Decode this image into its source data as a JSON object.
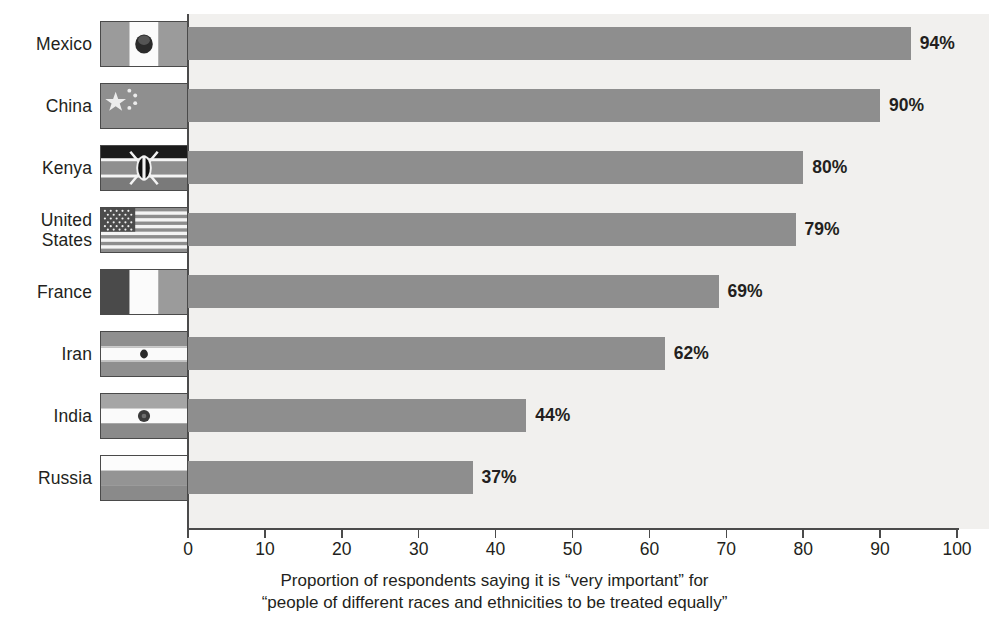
{
  "chart_data": {
    "type": "bar",
    "orientation": "horizontal",
    "title": "",
    "xlabel": "Proportion of respondents saying it is “very important” for “people of different races and ethnicities to be treated equally”",
    "ylabel": "",
    "xlim": [
      0,
      100
    ],
    "xticks": [
      0,
      10,
      20,
      30,
      40,
      50,
      60,
      70,
      80,
      90,
      100
    ],
    "grid": false,
    "legend": "none",
    "bar_color": "#8e8e8e",
    "plot_background": "#f1f0ee",
    "categories": [
      "Mexico",
      "China",
      "Kenya",
      "United States",
      "France",
      "Iran",
      "India",
      "Russia"
    ],
    "values": [
      94,
      90,
      80,
      79,
      69,
      62,
      44,
      37
    ],
    "value_labels": [
      "94%",
      "90%",
      "80%",
      "79%",
      "69%",
      "62%",
      "44%",
      "37%"
    ]
  },
  "caption": {
    "line1": "Proportion of respondents saying it is “very important” for",
    "line2": "“people of different races and ethnicities to be treated equally”"
  },
  "categories": [
    {
      "label": "Mexico",
      "flag_icon": "flag-mexico-icon",
      "value": 94,
      "value_label": "94%"
    },
    {
      "label": "China",
      "flag_icon": "flag-china-icon",
      "value": 90,
      "value_label": "90%"
    },
    {
      "label": "Kenya",
      "flag_icon": "flag-kenya-icon",
      "value": 80,
      "value_label": "80%"
    },
    {
      "label": "United\nStates",
      "flag_icon": "flag-united-states-icon",
      "value": 79,
      "value_label": "79%"
    },
    {
      "label": "France",
      "flag_icon": "flag-france-icon",
      "value": 69,
      "value_label": "69%"
    },
    {
      "label": "Iran",
      "flag_icon": "flag-iran-icon",
      "value": 62,
      "value_label": "62%"
    },
    {
      "label": "India",
      "flag_icon": "flag-india-icon",
      "value": 44,
      "value_label": "44%"
    },
    {
      "label": "Russia",
      "flag_icon": "flag-russia-icon",
      "value": 37,
      "value_label": "37%"
    }
  ],
  "axis": {
    "ticks": [
      "0",
      "10",
      "20",
      "30",
      "40",
      "50",
      "60",
      "70",
      "80",
      "90",
      "100"
    ]
  }
}
